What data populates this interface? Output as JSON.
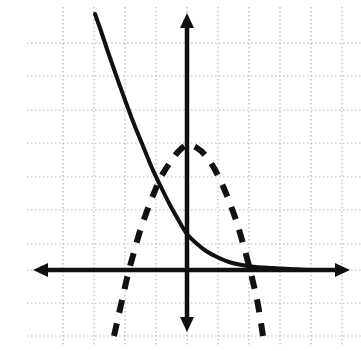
{
  "figure": {
    "part_label": "b.",
    "background_color": "#ffffff",
    "ink_color": "#111111",
    "grid_color": "#b8b8b8"
  },
  "chart_data": {
    "type": "line",
    "title": "",
    "subtitle": "",
    "xlabel": "",
    "ylabel": "",
    "annotations": [],
    "legend": [],
    "legend_position": "none",
    "grid": true,
    "grid_style": "dotted",
    "grid_spacing_px": {
      "x": 31,
      "y": 33.5
    },
    "axes": {
      "x_axis": {
        "label": "",
        "y_pixel": 270,
        "x_start_pixel": 33,
        "x_end_pixel": 350,
        "arrow_left": true,
        "arrow_right": true,
        "style": "solid"
      },
      "y_axis": {
        "label": "",
        "x_pixel": 187,
        "y_start_pixel": 13,
        "y_end_pixel": 332,
        "arrow_up": true,
        "arrow_down": true,
        "style": "solid"
      },
      "xlim_pixels": [
        33,
        350
      ],
      "ylim_pixels": [
        13,
        332
      ],
      "origin_pixel": [
        187,
        270
      ],
      "tick_labels_x": [],
      "tick_labels_y": []
    },
    "gridlines": {
      "vertical_x_pixels": [
        63,
        94,
        125,
        156,
        187,
        218,
        249,
        280,
        311,
        342
      ],
      "horizontal_y_pixels": [
        43,
        76,
        110,
        143,
        177,
        210,
        244,
        270,
        303,
        336
      ]
    },
    "series": [
      {
        "name": "exponential-decay-curve",
        "style": "solid",
        "stroke_width": 4,
        "color": "#111111",
        "shape": "decaying exponential, decreasing left to right, asymptotic to x-axis on the right",
        "points": [
          [
            95,
            14
          ],
          [
            101,
            31
          ],
          [
            108,
            52
          ],
          [
            116,
            75
          ],
          [
            125,
            100
          ],
          [
            134,
            124
          ],
          [
            143,
            146
          ],
          [
            152,
            168
          ],
          [
            161,
            187
          ],
          [
            170,
            205
          ],
          [
            179,
            221
          ],
          [
            187,
            234
          ],
          [
            196,
            243
          ],
          [
            206,
            251
          ],
          [
            217,
            257
          ],
          [
            229,
            262
          ],
          [
            242,
            265
          ],
          [
            256,
            267
          ],
          [
            272,
            268
          ],
          [
            290,
            269
          ],
          [
            310,
            270
          ],
          [
            340,
            270
          ]
        ]
      },
      {
        "name": "downward-parabola-curve",
        "style": "dashed",
        "stroke_width": 6,
        "dash_pattern": "13 11",
        "color": "#111111",
        "shape": "downward-opening parabola, vertex above x-axis on the y-axis",
        "vertex_pixel": [
          187,
          145
        ],
        "x_intercept_pixels": [
          126,
          249
        ],
        "points": [
          [
            114,
            336
          ],
          [
            118,
            318
          ],
          [
            123,
            296
          ],
          [
            128,
            274
          ],
          [
            134,
            252
          ],
          [
            140,
            231
          ],
          [
            147,
            211
          ],
          [
            154,
            193
          ],
          [
            161,
            177
          ],
          [
            169,
            164
          ],
          [
            177,
            153
          ],
          [
            187,
            145
          ],
          [
            197,
            148
          ],
          [
            206,
            156
          ],
          [
            214,
            168
          ],
          [
            222,
            184
          ],
          [
            229,
            201
          ],
          [
            236,
            220
          ],
          [
            242,
            240
          ],
          [
            248,
            262
          ],
          [
            253,
            282
          ],
          [
            258,
            305
          ],
          [
            263,
            336
          ]
        ]
      }
    ]
  }
}
